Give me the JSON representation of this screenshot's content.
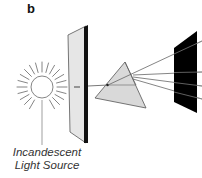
{
  "figure": {
    "panel_label": "b",
    "caption": {
      "line1": "Incandescent",
      "line2": "Light Source"
    },
    "components": [
      {
        "name": "light-source",
        "kind": "sun-icon"
      },
      {
        "name": "slit-plate",
        "kind": "plate-with-slit"
      },
      {
        "name": "prism",
        "kind": "triangular-prism"
      },
      {
        "name": "screen",
        "kind": "black-screen"
      }
    ],
    "dispersed_rays": 4,
    "colors": {
      "line": "#555555",
      "plate_fill": "#e4e4e4",
      "prism_fill": "#dcdcdc",
      "screen_fill": "#000000"
    }
  }
}
